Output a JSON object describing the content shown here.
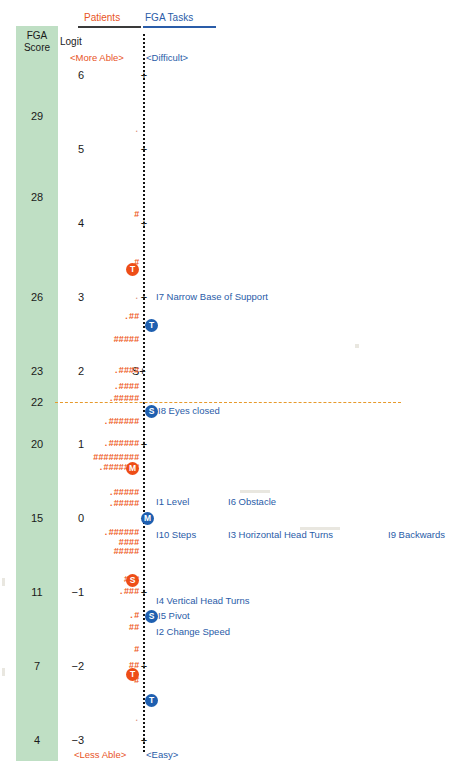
{
  "header": {
    "left_title": "Patients",
    "right_title": "FGA Tasks",
    "score_col_label_line1": "FGA",
    "score_col_label_line2": "Score",
    "logit_col_label": "Logit",
    "left_anchor_top": "<More Able>",
    "right_anchor_top": "<Difficult>",
    "left_anchor_bottom": "<Less Able>",
    "right_anchor_bottom": "<Easy>"
  },
  "colors": {
    "person_orange": "#ee5a24",
    "person_marker": "#ee4d17",
    "item_blue": "#2a5ca8",
    "item_marker": "#1e5fb0",
    "score_band_green": "#bfdfc4",
    "cutline_orange": "#e79a2c",
    "axis_black": "#111111"
  },
  "chart_data": {
    "type": "scatter",
    "xlabel": "",
    "ylabel": "Logit",
    "ylim": [
      -3,
      6
    ],
    "grid": false,
    "legend": "none",
    "axis_ticks": [
      "6",
      "5",
      "4",
      "3",
      "2",
      "1",
      "0",
      "-1",
      "-2",
      "-3"
    ],
    "tick_glyph": "+",
    "special_tick": {
      "logit": 2,
      "glyph": "S+"
    },
    "fga_score_axis": {
      "label": "FGA Score",
      "values": [
        29,
        28,
        26,
        23,
        22,
        20,
        15,
        11,
        7,
        4
      ]
    },
    "cut_line": {
      "fga_score": 22,
      "style": "dashed",
      "color": "#e79a2c"
    },
    "person_distribution": [
      {
        "logit": 5.25,
        "marks": ".",
        "faint": true
      },
      {
        "logit": 4.1,
        "marks": "#"
      },
      {
        "logit": 3.45,
        "marks": ".#"
      },
      {
        "logit": 3.0,
        "marks": ".",
        "faint": true
      },
      {
        "logit": 2.72,
        "marks": ".##"
      },
      {
        "logit": 2.42,
        "marks": "#####"
      },
      {
        "logit": 2.0,
        "marks": ".####"
      },
      {
        "logit": 1.78,
        "marks": ".####"
      },
      {
        "logit": 1.62,
        "marks": ".#####"
      },
      {
        "logit": 1.3,
        "marks": ".######"
      },
      {
        "logit": 1.0,
        "marks": ".######"
      },
      {
        "logit": 0.82,
        "marks": "#########"
      },
      {
        "logit": 0.68,
        "marks": ".#######"
      },
      {
        "logit": 0.34,
        "marks": ".#####"
      },
      {
        "logit": 0.2,
        "marks": ".#####"
      },
      {
        "logit": -0.2,
        "marks": ".######"
      },
      {
        "logit": -0.34,
        "marks": "####"
      },
      {
        "logit": -0.46,
        "marks": "#####"
      },
      {
        "logit": -0.84,
        "marks": "###"
      },
      {
        "logit": -1.0,
        "marks": ".###"
      },
      {
        "logit": -1.32,
        "marks": ".#"
      },
      {
        "logit": -1.48,
        "marks": "##"
      },
      {
        "logit": -1.78,
        "marks": "#"
      },
      {
        "logit": -2.0,
        "marks": "##"
      },
      {
        "logit": -2.2,
        "marks": "#"
      },
      {
        "logit": -2.72,
        "marks": ".",
        "faint": true
      }
    ],
    "person_stat_markers": [
      {
        "label": "T",
        "logit": 3.38,
        "side": "person"
      },
      {
        "label": "M",
        "logit": 0.68,
        "side": "person"
      },
      {
        "label": "S",
        "logit": -0.84,
        "side": "person"
      },
      {
        "label": "T",
        "logit": -2.1,
        "side": "person"
      }
    ],
    "item_stat_markers": [
      {
        "label": "T",
        "logit": 2.62,
        "side": "item"
      },
      {
        "label": "S",
        "logit": 1.45,
        "side": "item"
      },
      {
        "label": "M",
        "logit": 0.0,
        "side": "item"
      },
      {
        "label": "S",
        "logit": -1.32,
        "side": "item"
      },
      {
        "label": "T",
        "logit": -2.46,
        "side": "item"
      }
    ],
    "items": [
      {
        "id": "I7",
        "name": "I7 Narrow Base of Support",
        "logit": 3.0,
        "column": 1
      },
      {
        "id": "I8",
        "name": "I8 Eyes closed",
        "logit": 1.45,
        "column": 0
      },
      {
        "id": "I1",
        "name": "I1 Level",
        "logit": 0.22,
        "column": 1
      },
      {
        "id": "I6",
        "name": "I6 Obstacle",
        "logit": 0.22,
        "column": 2
      },
      {
        "id": "I10",
        "name": "I10 Steps",
        "logit": -0.22,
        "column": 1
      },
      {
        "id": "I3",
        "name": "I3 Horizontal Head Turns",
        "logit": -0.22,
        "column": 2
      },
      {
        "id": "I9",
        "name": "I9 Backwards",
        "logit": -0.22,
        "column": 3
      },
      {
        "id": "I4",
        "name": "I4 Vertical Head Turns",
        "logit": -1.12,
        "column": 1
      },
      {
        "id": "I5",
        "name": "I5 Pivot",
        "logit": -1.32,
        "column": 0
      },
      {
        "id": "I2",
        "name": "I2 Change Speed",
        "logit": -1.54,
        "column": 1
      }
    ]
  }
}
